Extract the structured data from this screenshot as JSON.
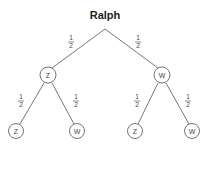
{
  "diagram": {
    "title": "Ralph",
    "type": "probability-tree",
    "level1": {
      "left": {
        "label": "Z",
        "probability": {
          "num": "1",
          "den": "2"
        }
      },
      "right": {
        "label": "W",
        "probability": {
          "num": "1",
          "den": "2"
        }
      }
    },
    "level2": [
      {
        "label": "Z",
        "probability": {
          "num": "1",
          "den": "2"
        }
      },
      {
        "label": "W",
        "probability": {
          "num": "1",
          "den": "2"
        }
      },
      {
        "label": "Z",
        "probability": {
          "num": "1",
          "den": "2"
        }
      },
      {
        "label": "W",
        "probability": {
          "num": "1",
          "den": "2"
        }
      }
    ],
    "colors": {
      "line": "#666666",
      "text": "#222222"
    }
  }
}
